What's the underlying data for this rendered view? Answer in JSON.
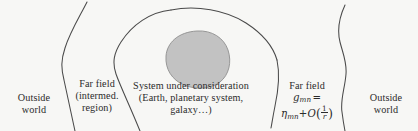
{
  "figure": {
    "background_color": "#f7f7f5",
    "stroke_color": "#4a4a4a",
    "blob_fill_color": "#c2c2c2",
    "blob_stroke_color": "#8f8f8f",
    "text_color": "#2b2b2b"
  },
  "zones": {
    "outside_world_left": {
      "lines": [
        "Outside",
        "world"
      ]
    },
    "far_field_intermediate": {
      "lines": [
        "Far field",
        "(intermed.",
        "region)"
      ]
    },
    "system_under_consideration": {
      "lines": [
        "System under consideration",
        "(Earth, planetary system,",
        "galaxy…)"
      ]
    },
    "far_field_asymptotic": {
      "label": "Far field",
      "metric_symbol": "g",
      "metric_indices": "mn",
      "equals": "=",
      "minkowski_symbol": "η",
      "minkowski_indices": "mn",
      "plus": "+",
      "order_symbol": "O",
      "order_open_paren": "(",
      "order_numerator": "1",
      "order_denominator": "r",
      "order_close_paren": ")"
    },
    "outside_world_right": {
      "lines": [
        "Outside",
        "world"
      ]
    }
  }
}
